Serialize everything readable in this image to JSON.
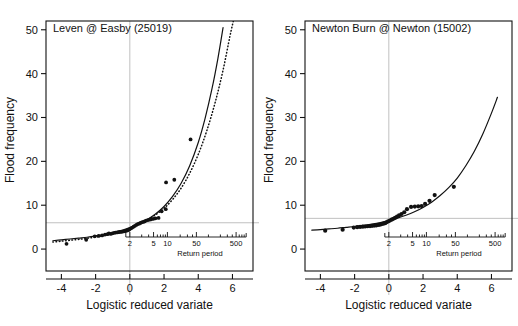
{
  "figure": {
    "type": "multi-panel-scatter-with-fit",
    "panel_count": 2,
    "background": "#ffffff",
    "ink": "#111111",
    "guide_color": "#b9b9b9"
  },
  "axes_common": {
    "ylabel": "Flood frequency",
    "xlabel": "Logistic reduced variate",
    "y_ticks": [
      "0",
      "10",
      "20",
      "30",
      "40",
      "50"
    ],
    "y_tick_values": [
      0,
      10,
      20,
      30,
      40,
      50
    ],
    "x_ticks": [
      "-4",
      "-2",
      "0",
      "2",
      "4",
      "6"
    ],
    "x_tick_values": [
      -4,
      -2,
      0,
      2,
      4,
      6
    ],
    "ylim": [
      -5,
      52
    ],
    "xlim": [
      -4.9,
      7.2
    ],
    "grid": false,
    "return_axis_label": "Return period",
    "return_ticks": [
      "2",
      "5",
      "10",
      "50",
      "500"
    ],
    "return_tick_values": [
      2,
      5,
      10,
      50,
      500
    ]
  },
  "chart_data": [
    {
      "type": "scatter",
      "panel": "left",
      "title": "Leven @ Easby (25019)",
      "station_name": "Leven @ Easby",
      "station_id": "25019",
      "xlabel": "Logistic reduced variate",
      "ylabel": "Flood frequency",
      "ylim": [
        -5,
        52
      ],
      "xlim": [
        -4.9,
        7.2
      ],
      "x_ticks": [
        -4,
        -2,
        0,
        2,
        4,
        6
      ],
      "y_ticks": [
        0,
        10,
        20,
        30,
        40,
        50
      ],
      "grid": false,
      "reference_lines": {
        "horizontal_y": 6.0,
        "vertical_x": 0.0
      },
      "points": [
        [
          -3.7,
          1.2
        ],
        [
          -2.55,
          2.1
        ],
        [
          -2.05,
          2.9
        ],
        [
          -1.82,
          3.0
        ],
        [
          -1.62,
          3.1
        ],
        [
          -1.45,
          3.3
        ],
        [
          -1.3,
          3.4
        ],
        [
          -1.22,
          3.6
        ],
        [
          -1.12,
          3.45
        ],
        [
          -1.02,
          3.6
        ],
        [
          -0.92,
          3.7
        ],
        [
          -0.84,
          3.75
        ],
        [
          -0.74,
          3.8
        ],
        [
          -0.66,
          3.85
        ],
        [
          -0.58,
          3.9
        ],
        [
          -0.5,
          3.95
        ],
        [
          -0.42,
          4.0
        ],
        [
          -0.34,
          4.05
        ],
        [
          -0.26,
          4.1
        ],
        [
          -0.18,
          4.2
        ],
        [
          -0.1,
          4.3
        ],
        [
          -0.02,
          4.5
        ],
        [
          0.06,
          4.7
        ],
        [
          0.14,
          4.9
        ],
        [
          0.22,
          5.1
        ],
        [
          0.3,
          5.3
        ],
        [
          0.38,
          5.5
        ],
        [
          0.46,
          5.7
        ],
        [
          0.54,
          5.8
        ],
        [
          0.62,
          5.95
        ],
        [
          0.7,
          6.1
        ],
        [
          0.78,
          6.2
        ],
        [
          0.86,
          6.3
        ],
        [
          0.95,
          6.5
        ],
        [
          1.05,
          6.6
        ],
        [
          1.15,
          6.7
        ],
        [
          1.25,
          6.8
        ],
        [
          1.38,
          6.9
        ],
        [
          1.5,
          7.0
        ],
        [
          1.68,
          7.1
        ],
        [
          1.86,
          8.6
        ],
        [
          2.1,
          9.1
        ],
        [
          2.12,
          15.2
        ],
        [
          2.6,
          15.8
        ],
        [
          3.55,
          25.0
        ]
      ],
      "curves": [
        {
          "name": "fitted-curve-solid",
          "style": "solid",
          "points": [
            [
              -4.5,
              1.9
            ],
            [
              -4.0,
              2.1
            ],
            [
              -3.5,
              2.3
            ],
            [
              -3.0,
              2.5
            ],
            [
              -2.5,
              2.7
            ],
            [
              -2.0,
              3.0
            ],
            [
              -1.5,
              3.3
            ],
            [
              -1.0,
              3.7
            ],
            [
              -0.5,
              4.2
            ],
            [
              0.0,
              4.9
            ],
            [
              0.5,
              5.7
            ],
            [
              1.0,
              6.7
            ],
            [
              1.5,
              8.0
            ],
            [
              2.0,
              9.7
            ],
            [
              2.5,
              12.0
            ],
            [
              3.0,
              15.0
            ],
            [
              3.5,
              19.0
            ],
            [
              4.0,
              24.3
            ],
            [
              4.4,
              29.8
            ],
            [
              4.8,
              36.5
            ],
            [
              5.15,
              43.5
            ],
            [
              5.45,
              50.5
            ]
          ]
        },
        {
          "name": "fitted-curve-dotted",
          "style": "dotted",
          "points": [
            [
              -4.5,
              1.6
            ],
            [
              -4.0,
              1.8
            ],
            [
              -3.5,
              2.0
            ],
            [
              -3.0,
              2.2
            ],
            [
              -2.5,
              2.45
            ],
            [
              -2.0,
              2.75
            ],
            [
              -1.5,
              3.1
            ],
            [
              -1.0,
              3.5
            ],
            [
              -0.5,
              4.05
            ],
            [
              0.0,
              4.75
            ],
            [
              0.5,
              5.6
            ],
            [
              1.0,
              6.6
            ],
            [
              1.5,
              7.8
            ],
            [
              2.0,
              9.3
            ],
            [
              2.5,
              11.3
            ],
            [
              3.0,
              13.9
            ],
            [
              3.5,
              17.3
            ],
            [
              4.0,
              21.6
            ],
            [
              4.5,
              27.0
            ],
            [
              5.0,
              33.6
            ],
            [
              5.45,
              40.8
            ],
            [
              5.85,
              48.5
            ],
            [
              6.05,
              52.0
            ]
          ]
        }
      ]
    },
    {
      "type": "scatter",
      "panel": "right",
      "title": "Newton Burn @ Newton (15002)",
      "station_name": "Newton Burn @ Newton",
      "station_id": "15002",
      "xlabel": "Logistic reduced variate",
      "ylabel": "Flood frequency",
      "ylim": [
        -5,
        52
      ],
      "xlim": [
        -4.9,
        7.2
      ],
      "x_ticks": [
        -4,
        -2,
        0,
        2,
        4,
        6
      ],
      "y_ticks": [
        0,
        10,
        20,
        30,
        40,
        50
      ],
      "grid": false,
      "reference_lines": {
        "horizontal_y": 7.0,
        "vertical_x": 0.0
      },
      "points": [
        [
          -3.72,
          4.2
        ],
        [
          -2.7,
          4.4
        ],
        [
          -2.05,
          4.9
        ],
        [
          -1.85,
          5.0
        ],
        [
          -1.68,
          5.05
        ],
        [
          -1.52,
          5.1
        ],
        [
          -1.38,
          5.15
        ],
        [
          -1.24,
          5.2
        ],
        [
          -1.1,
          5.25
        ],
        [
          -0.98,
          5.3
        ],
        [
          -0.86,
          5.35
        ],
        [
          -0.74,
          5.4
        ],
        [
          -0.62,
          5.5
        ],
        [
          -0.52,
          5.55
        ],
        [
          -0.42,
          5.7
        ],
        [
          -0.32,
          5.8
        ],
        [
          -0.22,
          5.9
        ],
        [
          -0.14,
          6.1
        ],
        [
          -0.04,
          6.3
        ],
        [
          0.06,
          6.5
        ],
        [
          0.16,
          6.7
        ],
        [
          0.26,
          6.9
        ],
        [
          0.36,
          7.1
        ],
        [
          0.48,
          7.4
        ],
        [
          0.6,
          7.7
        ],
        [
          0.74,
          8.0
        ],
        [
          0.9,
          8.4
        ],
        [
          1.06,
          9.1
        ],
        [
          1.3,
          9.6
        ],
        [
          1.52,
          9.7
        ],
        [
          1.72,
          9.75
        ],
        [
          1.92,
          9.8
        ],
        [
          2.12,
          10.3
        ],
        [
          2.38,
          11.0
        ],
        [
          2.68,
          12.3
        ],
        [
          3.8,
          14.2
        ]
      ],
      "curves": [
        {
          "name": "fitted-curve-solid",
          "style": "solid",
          "points": [
            [
              -4.5,
              4.3
            ],
            [
              -4.0,
              4.45
            ],
            [
              -3.5,
              4.6
            ],
            [
              -3.0,
              4.75
            ],
            [
              -2.5,
              4.95
            ],
            [
              -2.0,
              5.15
            ],
            [
              -1.5,
              5.4
            ],
            [
              -1.0,
              5.7
            ],
            [
              -0.5,
              6.05
            ],
            [
              0.0,
              6.5
            ],
            [
              0.5,
              7.05
            ],
            [
              1.0,
              7.7
            ],
            [
              1.5,
              8.5
            ],
            [
              2.0,
              9.5
            ],
            [
              2.5,
              10.7
            ],
            [
              3.0,
              12.2
            ],
            [
              3.5,
              14.0
            ],
            [
              4.0,
              16.2
            ],
            [
              4.5,
              19.0
            ],
            [
              5.0,
              22.3
            ],
            [
              5.5,
              26.3
            ],
            [
              6.0,
              31.0
            ],
            [
              6.35,
              34.6
            ]
          ]
        }
      ]
    }
  ]
}
